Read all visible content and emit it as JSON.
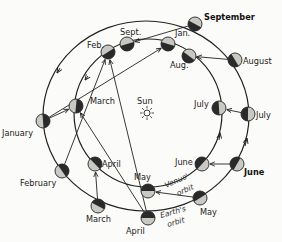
{
  "diagram": {
    "center_label": "Sun",
    "orbits": {
      "earth": {
        "label_line1": "Earth's",
        "label_line2": "orbit"
      },
      "venus": {
        "label_line1": "Venus'",
        "label_line2": "orbit"
      }
    },
    "earth_positions": [
      {
        "month": "January"
      },
      {
        "month": "February"
      },
      {
        "month": "March"
      },
      {
        "month": "April"
      },
      {
        "month": "May"
      },
      {
        "month": "June"
      },
      {
        "month": "July"
      },
      {
        "month": "August"
      },
      {
        "month": "September"
      }
    ],
    "venus_positions": [
      {
        "month": "March"
      },
      {
        "month": "April"
      },
      {
        "month": "May"
      },
      {
        "month": "June"
      },
      {
        "month": "July"
      },
      {
        "month": "Aug."
      },
      {
        "month": "Jan."
      },
      {
        "month": "Sept."
      },
      {
        "month": "Feb."
      }
    ],
    "sightlines": [
      {
        "from": "earth.January",
        "to": "venus.March"
      },
      {
        "from": "earth.February",
        "to": "venus.Feb."
      },
      {
        "from": "earth.March",
        "to": "venus.April"
      },
      {
        "from": "earth.April",
        "to": "venus.Feb."
      },
      {
        "from": "earth.April",
        "to": "venus.March"
      },
      {
        "from": "earth.May",
        "to": "venus.May"
      },
      {
        "from": "earth.June",
        "to": "venus.June"
      },
      {
        "from": "earth.July",
        "to": "venus.July"
      },
      {
        "from": "earth.August",
        "to": "venus.Aug."
      },
      {
        "from": "earth.September",
        "to": "venus.Sept."
      },
      {
        "from": "earth.January",
        "to": "venus.Jan."
      }
    ]
  }
}
